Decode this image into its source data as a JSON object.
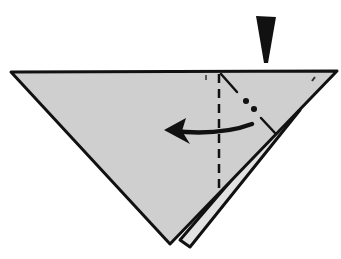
{
  "diagram": {
    "type": "origami-fold-step",
    "colors": {
      "paper": "#cfcfcf",
      "paper_back_layer": "#e2e2e2",
      "ink": "#111111",
      "background": "#ffffff"
    },
    "elements": {
      "push_arrow": "black wedge pointing down (squash/push here)",
      "valley_fold_line": "vertical dashed line",
      "mountain_fold_line": "dash-dot diagonal line",
      "fold_direction_arrow": "curved arrow pointing left"
    }
  }
}
